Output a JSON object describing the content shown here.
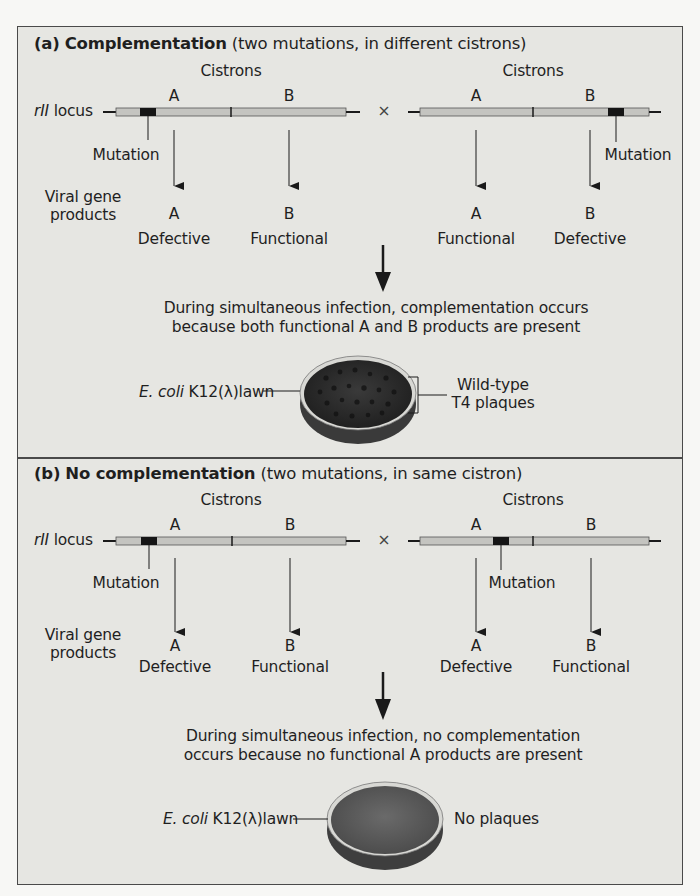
{
  "panel_a": {
    "label": "(a)",
    "title_bold": "Complementation",
    "title_rest": "(two mutations, in different cistrons)",
    "cistrons_left": "Cistrons",
    "cistrons_right": "Cistrons",
    "locus_italic": "rII",
    "locus_text": "locus",
    "cross_symbol": "×",
    "left_cistron_a": "A",
    "left_cistron_b": "B",
    "right_cistron_a": "A",
    "right_cistron_b": "B",
    "mutation_left": "Mutation",
    "mutation_right": "Mutation",
    "gene_products_line1": "Viral gene",
    "gene_products_line2": "products",
    "products": [
      {
        "letter": "A",
        "status": "Defective"
      },
      {
        "letter": "B",
        "status": "Functional"
      },
      {
        "letter": "A",
        "status": "Functional"
      },
      {
        "letter": "B",
        "status": "Defective"
      }
    ],
    "result_line1": "During simultaneous infection, complementation occurs",
    "result_line2": "because both functional A and B products are present",
    "lawn_italic": "E. coli",
    "lawn_text": "K12(λ)lawn",
    "plaque_line1": "Wild-type",
    "plaque_line2": "T4 plaques"
  },
  "panel_b": {
    "label": "(b)",
    "title_bold": "No complementation",
    "title_rest": "(two mutations, in same cistron)",
    "cistrons_left": "Cistrons",
    "cistrons_right": "Cistrons",
    "locus_italic": "rII",
    "locus_text": "locus",
    "cross_symbol": "×",
    "left_cistron_a": "A",
    "left_cistron_b": "B",
    "right_cistron_a": "A",
    "right_cistron_b": "B",
    "mutation_left": "Mutation",
    "mutation_right": "Mutation",
    "gene_products_line1": "Viral gene",
    "gene_products_line2": "products",
    "products": [
      {
        "letter": "A",
        "status": "Defective"
      },
      {
        "letter": "B",
        "status": "Functional"
      },
      {
        "letter": "A",
        "status": "Defective"
      },
      {
        "letter": "B",
        "status": "Functional"
      }
    ],
    "result_line1": "During simultaneous infection, no complementation",
    "result_line2": "occurs because no functional A products are present",
    "lawn_italic": "E. coli",
    "lawn_text": "K12(λ)lawn",
    "plaque_line1": "No plaques"
  },
  "colors": {
    "panel_bg": "#e6e6e2",
    "bar_fill": "#c4c4c0",
    "mutation_block": "#151515",
    "plate_dark": "#2b2b2b",
    "plate_medium": "#5a5a5a"
  }
}
